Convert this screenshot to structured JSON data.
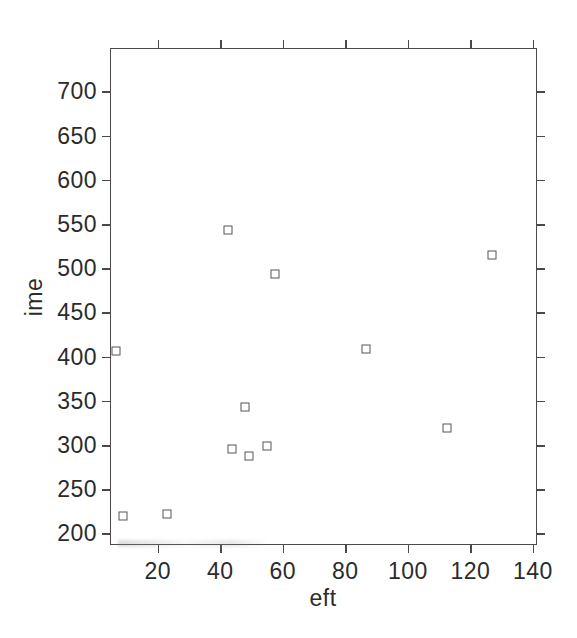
{
  "chart_data": {
    "type": "scatter",
    "title": "",
    "xlabel": "eft",
    "ylabel": "ime",
    "xlim": [
      5,
      141
    ],
    "ylim": [
      188,
      748
    ],
    "xticks": [
      20,
      40,
      60,
      80,
      100,
      120,
      140
    ],
    "yticks": [
      200,
      250,
      300,
      350,
      400,
      450,
      500,
      550,
      600,
      650,
      700
    ],
    "xtick_labels": [
      "20",
      "40",
      "60",
      "80",
      "100",
      "120",
      "140"
    ],
    "ytick_labels": [
      "200",
      "250",
      "300",
      "350",
      "400",
      "450",
      "500",
      "550",
      "600",
      "650",
      "700"
    ],
    "grid": false,
    "legend": null,
    "marker": "open-square",
    "marker_color": "#555555",
    "frame_color": "#4a4a4a",
    "background": "#ffffff",
    "points": [
      {
        "x": 6.6,
        "y": 406
      },
      {
        "x": 8.8,
        "y": 220
      },
      {
        "x": 22.9,
        "y": 222
      },
      {
        "x": 42.4,
        "y": 543
      },
      {
        "x": 43.7,
        "y": 296
      },
      {
        "x": 47.8,
        "y": 343
      },
      {
        "x": 49.1,
        "y": 287
      },
      {
        "x": 54.9,
        "y": 299
      },
      {
        "x": 57.4,
        "y": 494
      },
      {
        "x": 86.6,
        "y": 409
      },
      {
        "x": 112.5,
        "y": 319
      },
      {
        "x": 126.9,
        "y": 515
      }
    ],
    "x_values": [
      6.6,
      8.8,
      22.9,
      42.4,
      43.7,
      47.8,
      49.1,
      54.9,
      57.4,
      86.6,
      112.5,
      126.9
    ],
    "y_values": [
      406,
      220,
      222,
      543,
      296,
      343,
      287,
      299,
      494,
      409,
      319,
      515
    ]
  }
}
